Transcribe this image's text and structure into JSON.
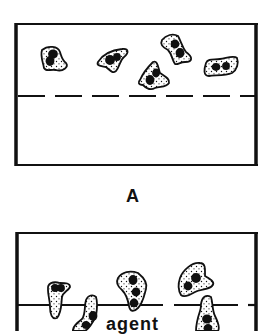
{
  "panels": [
    {
      "label": "A",
      "description": "Cells above a dashed (porous) membrane; no migration",
      "membrane_style": "dashed",
      "cell_count": 5
    },
    {
      "label": "",
      "annotation": "agent",
      "description": "Cells migrating through a membrane in presence of agent",
      "membrane_style": "solid-with-gaps",
      "cell_count": 6
    }
  ],
  "colors": {
    "ink": "#111111",
    "background": "#ffffff"
  }
}
